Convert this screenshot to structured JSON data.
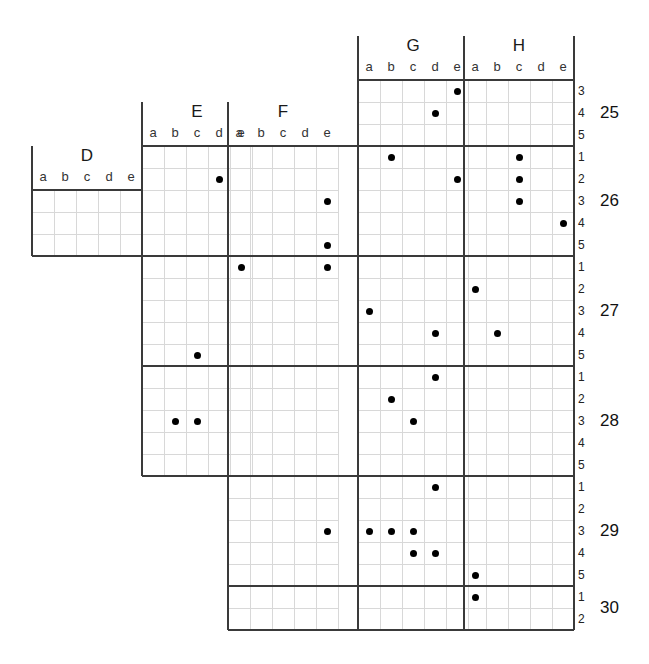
{
  "figure": {
    "title": ""
  },
  "chart_data": {
    "type": "scatter",
    "title": "",
    "xlabel": "",
    "ylabel": "",
    "grid": true,
    "legend": null,
    "cell_size": 22,
    "origin": {
      "x": 32,
      "y": 146
    },
    "column_groups": [
      {
        "name": "D",
        "sub": [
          "a",
          "b",
          "c",
          "d",
          "e"
        ],
        "start_index": 0
      },
      {
        "name": "E",
        "sub": [
          "a",
          "b",
          "c",
          "d",
          "e"
        ],
        "start_index": 5
      },
      {
        "name": "F",
        "sub": [
          "a",
          "b",
          "c",
          "d",
          "e"
        ],
        "start_index": 10
      },
      {
        "name": "G",
        "sub": [
          "a",
          "b",
          "c",
          "d",
          "e"
        ],
        "start_index": 15
      },
      {
        "name": "H",
        "sub": [
          "a",
          "b",
          "c",
          "d",
          "e"
        ],
        "start_index": 20
      }
    ],
    "row_groups": [
      {
        "name": "25",
        "sub": [
          "3",
          "4",
          "5"
        ],
        "start_index": 0
      },
      {
        "name": "26",
        "sub": [
          "1",
          "2",
          "3",
          "4",
          "5"
        ],
        "start_index": 3
      },
      {
        "name": "27",
        "sub": [
          "1",
          "2",
          "3",
          "4",
          "5"
        ],
        "start_index": 8
      },
      {
        "name": "28",
        "sub": [
          "1",
          "2",
          "3",
          "4",
          "5"
        ],
        "start_index": 13
      },
      {
        "name": "29",
        "sub": [
          "1",
          "2",
          "3",
          "4",
          "5"
        ],
        "start_index": 18
      },
      {
        "name": "30",
        "sub": [
          "1",
          "2"
        ],
        "start_index": 23
      }
    ],
    "points": [
      {
        "col": "G",
        "sub_col": "e",
        "row": "25",
        "sub_row": "3"
      },
      {
        "col": "G",
        "sub_col": "d",
        "row": "25",
        "sub_row": "4"
      },
      {
        "col": "E",
        "sub_col": "d",
        "row": "26",
        "sub_row": "2"
      },
      {
        "col": "F",
        "sub_col": "e",
        "row": "26",
        "sub_row": "3"
      },
      {
        "col": "F",
        "sub_col": "e",
        "row": "26",
        "sub_row": "5"
      },
      {
        "col": "G",
        "sub_col": "b",
        "row": "26",
        "sub_row": "1"
      },
      {
        "col": "G",
        "sub_col": "e",
        "row": "26",
        "sub_row": "2"
      },
      {
        "col": "H",
        "sub_col": "c",
        "row": "26",
        "sub_row": "1"
      },
      {
        "col": "H",
        "sub_col": "c",
        "row": "26",
        "sub_row": "2"
      },
      {
        "col": "H",
        "sub_col": "c",
        "row": "26",
        "sub_row": "3"
      },
      {
        "col": "H",
        "sub_col": "e",
        "row": "26",
        "sub_row": "4"
      },
      {
        "col": "E",
        "sub_col": "e",
        "row": "27",
        "sub_row": "1"
      },
      {
        "col": "F",
        "sub_col": "e",
        "row": "27",
        "sub_row": "1"
      },
      {
        "col": "G",
        "sub_col": "a",
        "row": "27",
        "sub_row": "3"
      },
      {
        "col": "G",
        "sub_col": "d",
        "row": "27",
        "sub_row": "4"
      },
      {
        "col": "H",
        "sub_col": "a",
        "row": "27",
        "sub_row": "2"
      },
      {
        "col": "H",
        "sub_col": "b",
        "row": "27",
        "sub_row": "4"
      },
      {
        "col": "E",
        "sub_col": "c",
        "row": "27",
        "sub_row": "5"
      },
      {
        "col": "E",
        "sub_col": "b",
        "row": "28",
        "sub_row": "3"
      },
      {
        "col": "E",
        "sub_col": "c",
        "row": "28",
        "sub_row": "3"
      },
      {
        "col": "G",
        "sub_col": "b",
        "row": "28",
        "sub_row": "2"
      },
      {
        "col": "G",
        "sub_col": "c",
        "row": "28",
        "sub_row": "3"
      },
      {
        "col": "G",
        "sub_col": "d",
        "row": "28",
        "sub_row": "1"
      },
      {
        "col": "G",
        "sub_col": "d",
        "row": "29",
        "sub_row": "1"
      },
      {
        "col": "F",
        "sub_col": "e",
        "row": "29",
        "sub_row": "3"
      },
      {
        "col": "G",
        "sub_col": "a",
        "row": "29",
        "sub_row": "3"
      },
      {
        "col": "G",
        "sub_col": "b",
        "row": "29",
        "sub_row": "3"
      },
      {
        "col": "G",
        "sub_col": "c",
        "row": "29",
        "sub_row": "3"
      },
      {
        "col": "G",
        "sub_col": "c",
        "row": "29",
        "sub_row": "4"
      },
      {
        "col": "G",
        "sub_col": "d",
        "row": "29",
        "sub_row": "4"
      },
      {
        "col": "H",
        "sub_col": "a",
        "row": "29",
        "sub_row": "5"
      },
      {
        "col": "H",
        "sub_col": "a",
        "row": "30",
        "sub_row": "1"
      }
    ],
    "point_style": {
      "marker": "circle",
      "color": "#000000",
      "size": 7
    }
  },
  "geometry": {
    "cell": 22,
    "grid_line_color": "#d8d8d8",
    "major_line_color": "#3a3a3a",
    "blocks": [
      {
        "name": "D",
        "x": 32,
        "y": 190,
        "cols": 5,
        "row_start": 5,
        "row_end": 8
      },
      {
        "name": "E",
        "x": 142,
        "y": 146,
        "cols": 5,
        "row_start": 3,
        "row_end": 18
      },
      {
        "name": "F",
        "x": 228,
        "y": 146,
        "cols": 5,
        "row_start": 3,
        "row_end": 25
      },
      {
        "name": "G",
        "x": 358,
        "y": 80,
        "cols": 5,
        "row_start": 0,
        "row_end": 25
      },
      {
        "name": "H",
        "x": 464,
        "y": 80,
        "cols": 5,
        "row_start": 0,
        "row_end": 25
      }
    ]
  }
}
